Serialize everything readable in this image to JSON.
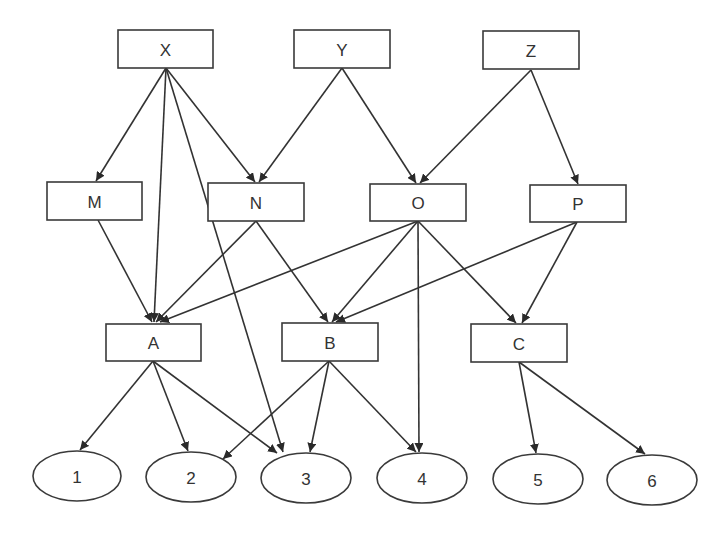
{
  "diagram": {
    "type": "directed-graph",
    "layers": [
      [
        "X",
        "Y",
        "Z"
      ],
      [
        "M",
        "N",
        "O",
        "P"
      ],
      [
        "A",
        "B",
        "C"
      ],
      [
        "1",
        "2",
        "3",
        "4",
        "5",
        "6"
      ]
    ],
    "nodes": [
      {
        "id": "X",
        "label": "X",
        "shape": "rect",
        "x": 118,
        "y": 30,
        "w": 95,
        "h": 38
      },
      {
        "id": "Y",
        "label": "Y",
        "shape": "rect",
        "x": 294,
        "y": 30,
        "w": 96,
        "h": 38
      },
      {
        "id": "Z",
        "label": "Z",
        "shape": "rect",
        "x": 483,
        "y": 31,
        "w": 96,
        "h": 38
      },
      {
        "id": "M",
        "label": "M",
        "shape": "rect",
        "x": 47,
        "y": 182,
        "w": 95,
        "h": 38
      },
      {
        "id": "N",
        "label": "N",
        "shape": "rect",
        "x": 208,
        "y": 183,
        "w": 96,
        "h": 38
      },
      {
        "id": "O",
        "label": "O",
        "shape": "rect",
        "x": 370,
        "y": 184,
        "w": 96,
        "h": 37
      },
      {
        "id": "P",
        "label": "P",
        "shape": "rect",
        "x": 530,
        "y": 185,
        "w": 96,
        "h": 37
      },
      {
        "id": "A",
        "label": "A",
        "shape": "rect",
        "x": 106,
        "y": 324,
        "w": 95,
        "h": 37
      },
      {
        "id": "B",
        "label": "B",
        "shape": "rect",
        "x": 282,
        "y": 323,
        "w": 96,
        "h": 38
      },
      {
        "id": "C",
        "label": "C",
        "shape": "rect",
        "x": 471,
        "y": 324,
        "w": 96,
        "h": 38
      },
      {
        "id": "1",
        "label": "1",
        "shape": "ellipse",
        "cx": 77,
        "cy": 476,
        "rx": 44,
        "ry": 25
      },
      {
        "id": "2",
        "label": "2",
        "shape": "ellipse",
        "cx": 191,
        "cy": 477,
        "rx": 45,
        "ry": 25
      },
      {
        "id": "3",
        "label": "3",
        "shape": "ellipse",
        "cx": 306,
        "cy": 478,
        "rx": 45,
        "ry": 25
      },
      {
        "id": "4",
        "label": "4",
        "shape": "ellipse",
        "cx": 422,
        "cy": 478,
        "rx": 45,
        "ry": 25
      },
      {
        "id": "5",
        "label": "5",
        "shape": "ellipse",
        "cx": 538,
        "cy": 479,
        "rx": 45,
        "ry": 25
      },
      {
        "id": "6",
        "label": "6",
        "shape": "ellipse",
        "cx": 652,
        "cy": 480,
        "rx": 45,
        "ry": 25
      }
    ],
    "edges": [
      {
        "from": "X",
        "to": "M",
        "x1": 166,
        "y1": 68,
        "x2": 96,
        "y2": 181
      },
      {
        "from": "X",
        "to": "A",
        "x1": 166,
        "y1": 68,
        "x2": 154,
        "y2": 322
      },
      {
        "from": "X",
        "to": "3",
        "x1": 166,
        "y1": 68,
        "x2": 283,
        "y2": 452
      },
      {
        "from": "X",
        "to": "N",
        "x1": 166,
        "y1": 68,
        "x2": 255,
        "y2": 182
      },
      {
        "from": "Y",
        "to": "N",
        "x1": 342,
        "y1": 68,
        "x2": 259,
        "y2": 182
      },
      {
        "from": "Y",
        "to": "O",
        "x1": 342,
        "y1": 68,
        "x2": 416,
        "y2": 183
      },
      {
        "from": "Z",
        "to": "O",
        "x1": 531,
        "y1": 70,
        "x2": 420,
        "y2": 183
      },
      {
        "from": "Z",
        "to": "P",
        "x1": 531,
        "y1": 70,
        "x2": 578,
        "y2": 184
      },
      {
        "from": "M",
        "to": "A",
        "x1": 98,
        "y1": 220,
        "x2": 152,
        "y2": 322
      },
      {
        "from": "N",
        "to": "A",
        "x1": 256,
        "y1": 221,
        "x2": 156,
        "y2": 322
      },
      {
        "from": "N",
        "to": "B",
        "x1": 256,
        "y1": 221,
        "x2": 328,
        "y2": 322
      },
      {
        "from": "O",
        "to": "A",
        "x1": 418,
        "y1": 221,
        "x2": 160,
        "y2": 322
      },
      {
        "from": "O",
        "to": "B",
        "x1": 418,
        "y1": 221,
        "x2": 332,
        "y2": 322
      },
      {
        "from": "O",
        "to": "4",
        "x1": 418,
        "y1": 221,
        "x2": 419,
        "y2": 452
      },
      {
        "from": "O",
        "to": "C",
        "x1": 418,
        "y1": 221,
        "x2": 516,
        "y2": 323
      },
      {
        "from": "P",
        "to": "B",
        "x1": 577,
        "y1": 222,
        "x2": 336,
        "y2": 322
      },
      {
        "from": "P",
        "to": "C",
        "x1": 577,
        "y1": 222,
        "x2": 522,
        "y2": 323
      },
      {
        "from": "A",
        "to": "1",
        "x1": 153,
        "y1": 361,
        "x2": 80,
        "y2": 450
      },
      {
        "from": "A",
        "to": "2",
        "x1": 153,
        "y1": 361,
        "x2": 188,
        "y2": 451
      },
      {
        "from": "A",
        "to": "3",
        "x1": 153,
        "y1": 361,
        "x2": 277,
        "y2": 453
      },
      {
        "from": "B",
        "to": "2",
        "x1": 329,
        "y1": 361,
        "x2": 223,
        "y2": 459
      },
      {
        "from": "B",
        "to": "3",
        "x1": 329,
        "y1": 361,
        "x2": 310,
        "y2": 452
      },
      {
        "from": "B",
        "to": "4",
        "x1": 329,
        "y1": 361,
        "x2": 416,
        "y2": 452
      },
      {
        "from": "C",
        "to": "5",
        "x1": 519,
        "y1": 362,
        "x2": 536,
        "y2": 453
      },
      {
        "from": "C",
        "to": "6",
        "x1": 519,
        "y1": 362,
        "x2": 645,
        "y2": 454
      }
    ]
  },
  "colors": {
    "stroke": "#333333",
    "fill": "#ffffff",
    "text": "#333333",
    "background": "#ffffff"
  }
}
